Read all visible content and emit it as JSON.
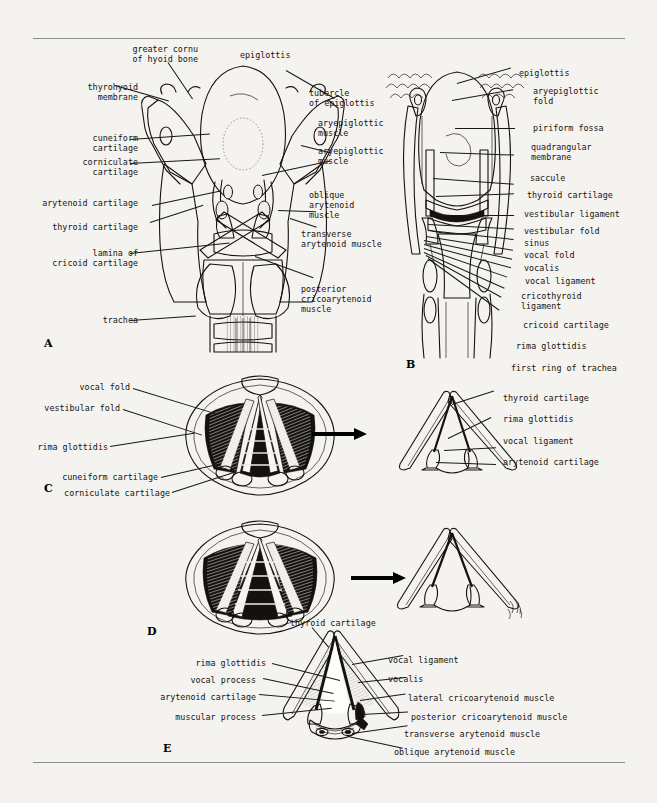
{
  "figure": {
    "panel_letters": [
      "A",
      "B",
      "C",
      "D",
      "E"
    ]
  },
  "panels": {
    "A": {
      "letter": "A",
      "description": "Posterior view of the larynx showing intrinsic muscles",
      "labels_left": [
        "greater cornu\nof hyoid bone",
        "thyrohyoid\nmembrane",
        "cuneiform\ncartilage",
        "corniculate\ncartilage",
        "arytenoid cartilage",
        "thyroid cartilage",
        "lamina of\ncricoid cartilage",
        "trachea"
      ],
      "labels_top": [
        "epiglottis"
      ],
      "labels_right": [
        "tubercle\nof epiglottis",
        "aryepiglottic\nmuscle",
        "aryepiglottic\nmuscle",
        "oblique\narytenoid\nmuscle",
        "transverse\narytenoid muscle",
        "posterior\ncricoarytenoid\nmuscle"
      ]
    },
    "B": {
      "letter": "B",
      "description": "Coronal section of the larynx",
      "labels_right": [
        "epiglottis",
        "aryepiglottic\nfold",
        "piriform fossa",
        "quadrangular\nmembrane",
        "saccule",
        "thyroid cartilage",
        "vestibular ligament",
        "vestibular fold",
        "sinus",
        "vocal fold",
        "vocalis",
        "vocal ligament",
        "cricothyroid\nligament",
        "cricoid cartilage",
        "rima glottidis",
        "first ring of trachea"
      ]
    },
    "C": {
      "letter": "C",
      "description": "Laryngoscopic view — quiet respiration",
      "labels_left": [
        "vocal fold",
        "vestibular fold",
        "rima glottidis",
        "cuneiform cartilage",
        "corniculate cartilage"
      ],
      "schematic_labels_right": [
        "thyroid cartilage",
        "rima glottidis",
        "vocal ligament",
        "arytenoid cartilage"
      ]
    },
    "D": {
      "letter": "D",
      "description": "Laryngoscopic view — phonation",
      "labels_left": [],
      "schematic_labels_right": []
    },
    "E": {
      "letter": "E",
      "description": "Transverse section showing action of the intrinsic muscles",
      "labels_top": [
        "thyroid cartilage"
      ],
      "labels_left": [
        "rima glottidis",
        "vocal process",
        "arytenoid cartilage",
        "muscular process"
      ],
      "labels_right": [
        "vocal ligament",
        "vocalis",
        "lateral cricoarytenoid muscle",
        "posterior cricoarytenoid muscle",
        "transverse arytenoid muscle",
        "oblique arytenoid muscle"
      ]
    }
  },
  "colors": {
    "page_background": "#f4f3ef",
    "ink": "#15120f",
    "rule": "#8d8d8d",
    "label_text": "#16130f"
  }
}
